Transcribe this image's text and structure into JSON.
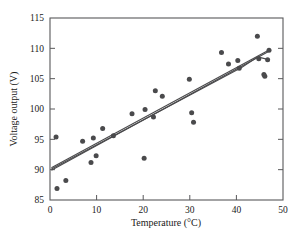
{
  "chart_data": {
    "type": "scatter",
    "title": "",
    "xlabel": "Temperature (°C)",
    "ylabel": "Voltage output (V)",
    "xlim": [
      0,
      50
    ],
    "ylim": [
      85,
      115
    ],
    "xticks": [
      0,
      10,
      20,
      30,
      40,
      50
    ],
    "yticks": [
      85,
      90,
      95,
      100,
      105,
      110,
      115
    ],
    "xtick_labels": [
      "0",
      "10",
      "20",
      "30",
      "40",
      "50"
    ],
    "ytick_labels": [
      "85",
      "90",
      "95",
      "100",
      "105",
      "110",
      "115"
    ],
    "grid": false,
    "legend": "none",
    "marker": "filled-circle",
    "marker_color": "#4a4a4c",
    "line_color": "#4a4a4c",
    "points": [
      {
        "x": 1.3,
        "y": 95.4
      },
      {
        "x": 1.5,
        "y": 86.9
      },
      {
        "x": 3.4,
        "y": 88.2
      },
      {
        "x": 7.0,
        "y": 94.7
      },
      {
        "x": 8.8,
        "y": 91.2
      },
      {
        "x": 9.3,
        "y": 95.2
      },
      {
        "x": 9.9,
        "y": 92.3
      },
      {
        "x": 11.3,
        "y": 96.8
      },
      {
        "x": 13.6,
        "y": 95.6
      },
      {
        "x": 17.6,
        "y": 99.2
      },
      {
        "x": 20.2,
        "y": 91.9
      },
      {
        "x": 20.4,
        "y": 99.9
      },
      {
        "x": 22.2,
        "y": 98.7
      },
      {
        "x": 22.6,
        "y": 103.0
      },
      {
        "x": 24.1,
        "y": 102.1
      },
      {
        "x": 29.9,
        "y": 104.9
      },
      {
        "x": 30.4,
        "y": 99.4
      },
      {
        "x": 30.8,
        "y": 97.8
      },
      {
        "x": 36.8,
        "y": 109.3
      },
      {
        "x": 38.3,
        "y": 107.4
      },
      {
        "x": 40.3,
        "y": 108.0
      },
      {
        "x": 40.6,
        "y": 106.7
      },
      {
        "x": 44.5,
        "y": 112.0
      },
      {
        "x": 44.8,
        "y": 108.3
      },
      {
        "x": 45.9,
        "y": 105.7
      },
      {
        "x": 46.1,
        "y": 105.4
      },
      {
        "x": 46.7,
        "y": 108.1
      },
      {
        "x": 47.0,
        "y": 109.7
      }
    ],
    "fit_lines": [
      {
        "name": "least-squares-fit",
        "points": [
          [
            0.3,
            90.3
          ],
          [
            47.2,
            109.8
          ]
        ]
      },
      {
        "name": "alternate-fit-a",
        "points": [
          [
            0.3,
            89.9
          ],
          [
            47.2,
            109.6
          ]
        ]
      },
      {
        "name": "alternate-fit-b",
        "points": [
          [
            0.3,
            90.1
          ],
          [
            41.2,
            106.9
          ],
          [
            44.6,
            108.6
          ],
          [
            47.1,
            108.1
          ]
        ]
      }
    ]
  },
  "axes": {
    "x_title": "Temperature (°C)",
    "y_title": "Voltage output (V)"
  }
}
